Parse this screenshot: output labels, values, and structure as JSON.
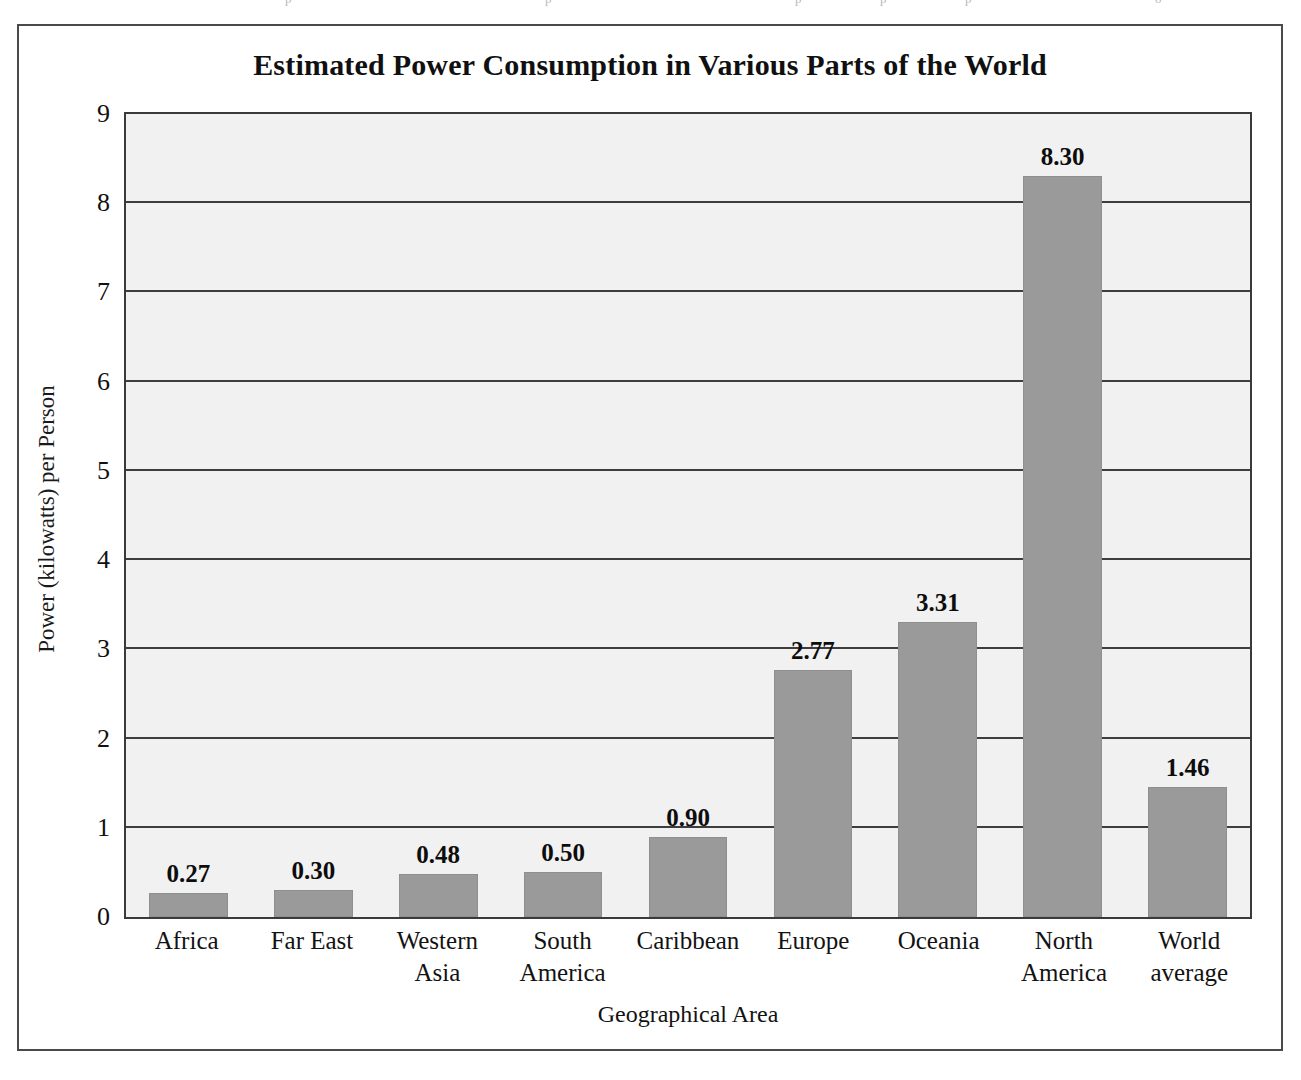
{
  "figure": {
    "frame_border_color": "#4a4a4a",
    "background_color": "#ffffff"
  },
  "chart_data": {
    "type": "bar",
    "title": "Estimated Power Consumption in Various Parts of the World",
    "xlabel": "Geographical Area",
    "ylabel": "Power (kilowatts) per Person",
    "categories": [
      "Africa",
      "Far East",
      "Western Asia",
      "South America",
      "Caribbean",
      "Europe",
      "Oceania",
      "North America",
      "World average"
    ],
    "category_lines": [
      [
        "Africa"
      ],
      [
        "Far East"
      ],
      [
        "Western",
        "Asia"
      ],
      [
        "South",
        "America"
      ],
      [
        "Caribbean"
      ],
      [
        "Europe"
      ],
      [
        "Oceania"
      ],
      [
        "North",
        "America"
      ],
      [
        "World",
        "average"
      ]
    ],
    "values": [
      0.27,
      0.3,
      0.48,
      0.5,
      0.9,
      2.77,
      3.31,
      8.3,
      1.46
    ],
    "value_labels": [
      "0.27",
      "0.30",
      "0.48",
      "0.50",
      "0.90",
      "2.77",
      "3.31",
      "8.30",
      "1.46"
    ],
    "ylim": [
      0,
      9
    ],
    "yticks": [
      0,
      1,
      2,
      3,
      4,
      5,
      6,
      7,
      8,
      9
    ],
    "ytick_labels": [
      "0",
      "1",
      "2",
      "3",
      "4",
      "5",
      "6",
      "7",
      "8",
      "9"
    ],
    "grid": true,
    "grid_axis": "y",
    "legend": false,
    "bar_color": "#9a9a9a",
    "plot_background_color": "#f1f1f1",
    "gridline_color": "#3d3d3d",
    "axis_color": "#3a3a3a"
  },
  "scan_artifacts": [
    {
      "text": "p",
      "left": 285
    },
    {
      "text": "p",
      "left": 545
    },
    {
      "text": "p",
      "left": 795
    },
    {
      "text": "p",
      "left": 880
    },
    {
      "text": "p",
      "left": 965
    },
    {
      "text": "o",
      "left": 1155
    }
  ]
}
